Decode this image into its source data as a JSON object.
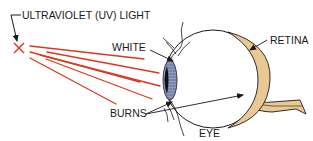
{
  "diagram": {
    "labels": {
      "source": "ULTRAVIOLET (UV) LIGHT",
      "white": "WHITE",
      "retina": "RETINA",
      "burns": "BURNS",
      "eye": "EYE"
    },
    "colors": {
      "rays": "#d9391f",
      "retina_fill": "#e9c893",
      "iris_blue": "#5d6f9e",
      "pupil": "#0d0d1a",
      "outline": "#1a1a1a",
      "background": "#ffffff"
    },
    "ray_count": 6
  }
}
